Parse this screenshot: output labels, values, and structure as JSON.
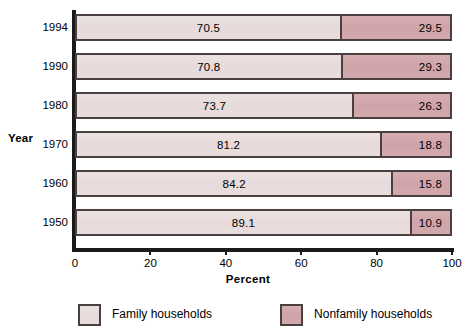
{
  "chart_data": {
    "type": "bar",
    "orientation": "horizontal",
    "stacked": true,
    "stack_total": 100,
    "title": "",
    "xlabel": "Percent",
    "ylabel": "Year",
    "xlim": [
      0,
      100
    ],
    "xticks": [
      0,
      20,
      40,
      60,
      80,
      100
    ],
    "xtick_labels": [
      "0",
      "20",
      "40",
      "60",
      "80",
      "100"
    ],
    "grid": false,
    "legend_position": "bottom",
    "categories": [
      "1994",
      "1990",
      "1980",
      "1970",
      "1960",
      "1950"
    ],
    "series": [
      {
        "name": "Family households",
        "color": "#e8dcdc",
        "values": [
          70.5,
          70.8,
          73.7,
          81.2,
          84.2,
          89.1
        ],
        "labels": [
          "70.5",
          "70.8",
          "73.7",
          "81.2",
          "84.2",
          "89.1"
        ]
      },
      {
        "name": "Nonfamily households",
        "color": "#d2a6aa",
        "values": [
          29.5,
          29.3,
          26.3,
          18.8,
          15.8,
          10.9
        ],
        "labels": [
          "29.5",
          "29.3",
          "26.3",
          "18.8",
          "15.8",
          "10.9"
        ]
      }
    ]
  },
  "axes": {
    "y_title": "Year",
    "x_title": "Percent",
    "y_categories": [
      "1994",
      "1990",
      "1980",
      "1970",
      "1960",
      "1950"
    ],
    "x_tick_labels": [
      "0",
      "20",
      "40",
      "60",
      "80",
      "100"
    ]
  },
  "legend": {
    "items": [
      {
        "label": "Family households",
        "color": "#e8dcdc"
      },
      {
        "label": "Nonfamily households",
        "color": "#d2a6aa"
      }
    ]
  },
  "colors": {
    "family": "#e8dcdc",
    "nonfamily": "#d2a6aa",
    "outline": "#4a4040",
    "axis": "#1a1a1a",
    "background": "#ffffff",
    "text": "#000000"
  },
  "rows": [
    {
      "year": "1994",
      "family": "70.5",
      "nonfamily": "29.5",
      "family_pct": 70.5,
      "nonfamily_pct": 29.5
    },
    {
      "year": "1990",
      "family": "70.8",
      "nonfamily": "29.3",
      "family_pct": 70.8,
      "nonfamily_pct": 29.3
    },
    {
      "year": "1980",
      "family": "73.7",
      "nonfamily": "26.3",
      "family_pct": 73.7,
      "nonfamily_pct": 26.3
    },
    {
      "year": "1970",
      "family": "81.2",
      "nonfamily": "18.8",
      "family_pct": 81.2,
      "nonfamily_pct": 18.8
    },
    {
      "year": "1960",
      "family": "84.2",
      "nonfamily": "15.8",
      "family_pct": 84.2,
      "nonfamily_pct": 15.8
    },
    {
      "year": "1950",
      "family": "89.1",
      "nonfamily": "10.9",
      "family_pct": 89.1,
      "nonfamily_pct": 10.9
    }
  ]
}
